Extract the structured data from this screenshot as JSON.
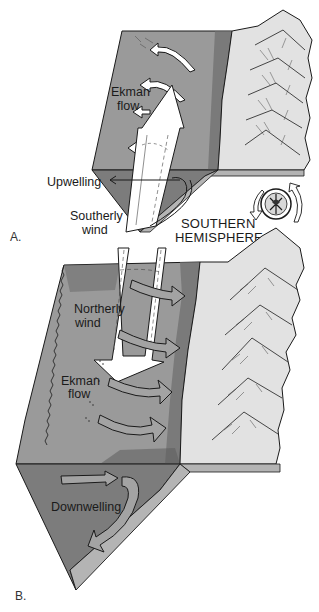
{
  "figure": {
    "panels": [
      {
        "id": "A",
        "label": "A.",
        "hemisphere": "",
        "labels": {
          "ekman_line1": "Ekman",
          "ekman_line2": "flow",
          "vertical_motion": "Upwelling",
          "wind_line1": "Southerly",
          "wind_line2": "wind"
        }
      },
      {
        "id": "B",
        "label": "B.",
        "labels": {
          "wind_line1": "Northerly",
          "wind_line2": "wind",
          "ekman_line1": "Ekman",
          "ekman_line2": "flow",
          "vertical_motion": "Downwelling"
        }
      }
    ],
    "hemisphere_label_line1": "SOUTHERN",
    "hemisphere_label_line2": "HEMISPHERE",
    "icons": {
      "earth_globe": "globe-rotation-icon"
    },
    "colors": {
      "ocean_surface": "#9a9a9a",
      "ocean_section": "#7c7c7c",
      "shelf": "#b4b4b4",
      "land": "#e2e2e2",
      "arrow_fill": "#ffffff",
      "ekman_arrow_fill": "#a3a3a3",
      "outline": "#1a1a1a"
    }
  }
}
